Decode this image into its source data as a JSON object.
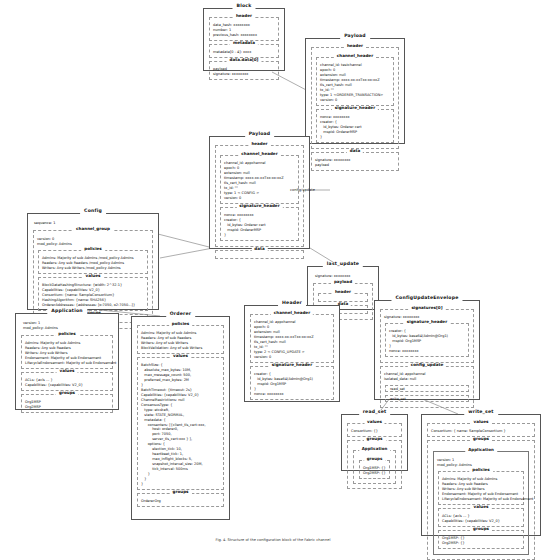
{
  "diagram": {
    "caption": "Fig. 4. Structure of the configuration block of the Fabric channel",
    "edge_labels": [
      {
        "text": "config/update"
      }
    ]
  },
  "block": {
    "title": "Block",
    "header": {
      "title": "header",
      "rows": [
        "data_hash: xxxxxxxx",
        "number: 1",
        "previous_hash: xxxxxxxx"
      ]
    },
    "metadata": {
      "title": "metadata",
      "rows": [
        "metadata[0 - 4]: xxxx"
      ]
    },
    "data": {
      "title": "data.data[0]",
      "rows": [
        "payload",
        "signature: xxxxxxxx"
      ]
    }
  },
  "payload_top": {
    "title": "Payload",
    "header": {
      "title": "header"
    },
    "channel_header": {
      "title": "channel_header",
      "rows": [
        "channel_id: testchannel",
        "epoch: 0",
        "extension: null",
        "timestamp: xxxx-xx-xxTxx:xx:xxZ",
        "tls_cert_hash: null",
        "tx_id: \"\"",
        "type: 1 <ORDERER_TRANSACTION>",
        "version: 0"
      ]
    },
    "signature_header": {
      "title": "signature_header",
      "rows": [
        "nonce: xxxxxxxx",
        "creator: {",
        "   id_bytes: Orderer cert",
        "   mspid: OrdererMSP",
        "}"
      ]
    },
    "data": {
      "title": "data",
      "rows": [
        "signature: xxxxxxxx",
        "payload"
      ]
    }
  },
  "payload_mid": {
    "title": "Payload",
    "header": {
      "title": "header"
    },
    "channel_header": {
      "title": "channel_header",
      "rows": [
        "channel_id: appchannel",
        "epoch: 0",
        "extension: null",
        "timestamp: xxxx-xx-xxTxx:xx:xxZ",
        "tls_cert_hash: null",
        "tx_id: \"\"",
        "type: 1 < CONFIG >",
        "version: 0"
      ]
    },
    "signature_header": {
      "title": "signature_header",
      "rows": [
        "nonce: xxxxxxxx",
        "creator: {",
        "   id_bytes: Orderer cert",
        "   mspid: OrdererMSP",
        "}"
      ]
    },
    "data": {
      "title": "data"
    }
  },
  "config": {
    "title": "Config",
    "sequence": "sequence: 1",
    "channel_group": {
      "title": "channel_group",
      "rows": [
        "version: 0",
        "mod_policy: Admins"
      ],
      "policies": {
        "title": "policies",
        "rows": [
          "Admins: Majority of sub Admins /mod_policy Admins",
          "Readers: Any sub Readers /mod_policy Admins",
          "Writers: Any sub Writers /mod_policy Admins"
        ]
      },
      "values": {
        "title": "values",
        "rows": [
          "BlockDataHashingStructure: {width: 2^32-1}",
          "Capabilities: {capabilities: V2_0}",
          "Consortium: {name: SampleConsortium}",
          "HashingAlgorithm: {name: SHA256}",
          "OrdererAddresses: {addresses: [o:7050, o2:7050...]}"
        ]
      },
      "groups": {
        "title": "groups"
      }
    }
  },
  "application": {
    "title": "Application",
    "rows": [
      "version: 1",
      "mod_policy: Admins"
    ],
    "policies": {
      "title": "policies",
      "rows": [
        "Admins: Majority of sub Admins",
        "Readers: Any sub Readers",
        "Writers: Any sub Writers",
        "Endorsement: Majority of sub Endorsement",
        "LifecycleEndorsement: Majority of sub Endorsement"
      ]
    },
    "values": {
      "title": "values",
      "rows": [
        "ACLs: {acls ... }",
        "Capabilities: {capabilities: V2_0}"
      ]
    },
    "groups": {
      "title": "groups",
      "rows": [
        "Org1MSP",
        "Org2MSP"
      ]
    }
  },
  "orderer": {
    "title": "Orderer",
    "policies": {
      "title": "policies",
      "rows": [
        "Admins: Majority of sub Admins",
        "Readers: Any of sub Readers",
        "Writers: Any of sub Writers",
        "BlockValidation: Any of sub Writers"
      ]
    },
    "values": {
      "title": "values",
      "rows": [
        "BatchSize: {",
        "   absolute_max_bytes: 10M,",
        "   max_message_count: 500,",
        "   preferred_max_bytes: 2M",
        "}",
        "BatchTimeout: {timeout: 2s}",
        "Capabilities: {capabilities: V2_0}",
        "ChannelRestrictions: null",
        "ConsensusType: {",
        "   type: etcdraft,",
        "   state: STATE_NORMAL,",
        "   metadata: {",
        "      consenters: [{client_tls_cert:xxx,",
        "          host: orderer0,",
        "          port: 7050,",
        "          server_tls_cert:xxx } ],",
        "      options: {",
        "          election_tick: 10,",
        "          heartbeat_tick: 1,",
        "          max_inflight_blocks: 5,",
        "          snapshot_interval_size: 20M,",
        "          tick_interval: 500ms",
        "      }",
        "   }",
        "}"
      ]
    },
    "groups": {
      "title": "groups",
      "rows": [
        "OrdererOrg"
      ]
    }
  },
  "last_update": {
    "title": "last_update",
    "rows": [
      "signature: xxxxxxxx"
    ],
    "payload": {
      "title": "payload",
      "header": {
        "title": "header"
      },
      "data": {
        "title": "data"
      }
    }
  },
  "header_box": {
    "title": "Header",
    "channel_header": {
      "title": "channel_header",
      "rows": [
        "channel_id: appchannel",
        "epoch: 0",
        "extension: null",
        "timestamp: xxxx-xx-xxTxx:xx:xxZ",
        "tls_cert_hash: null",
        "tx_id: \"\"",
        "type: 2 < CONFIG_UPDATE >",
        "version: 0"
      ]
    },
    "signature_header": {
      "title": "signature_header",
      "rows": [
        "creator: {",
        "   id_bytes: base64(Admin@Org1)",
        "   mspid: Org1MSP",
        "}",
        "nonce: xxxxxxxx"
      ]
    }
  },
  "config_update_envelope": {
    "title": "ConfigUpdateEnvelope",
    "signatures": {
      "title": "signatures[0]",
      "rows": [
        "signature: xxxxxxxx"
      ],
      "signature_header": {
        "title": "signature_header",
        "rows": [
          "creator: {",
          "   id_bytes: base64(Admin@Org1)",
          "   mspid: Org1MSP",
          "}",
          "nonce: xxxxxxxx"
        ]
      }
    },
    "config_update": {
      "title": "config_update",
      "rows": [
        "channel_id: appchannel",
        "isolated_data: null"
      ],
      "read_set_ref": "read_set",
      "write_set_ref": "write_set"
    }
  },
  "read_set": {
    "title": "read_set",
    "values": {
      "title": "values",
      "rows": [
        "Consortium: {}"
      ]
    },
    "groups": {
      "title": "groups",
      "application": {
        "title": "Application",
        "groups": {
          "title": "groups",
          "rows": [
            "Org1MSP: {}",
            "Org2MSP: {}"
          ]
        }
      }
    }
  },
  "write_set": {
    "title": "write_set",
    "values": {
      "title": "values",
      "rows": [
        "Consortium: { name: SampleConsortium }"
      ]
    },
    "groups": {
      "title": "groups",
      "application": {
        "title": "Application",
        "rows": [
          "version: 1",
          "mod_policy: Admins"
        ],
        "policies": {
          "title": "policies",
          "rows": [
            "Admins: Majority of sub Admins",
            "Readers: Any sub Readers",
            "Writers: Any sub Writers",
            "Endorsement: Majority of sub Endorsement",
            "LifecycleEndorsement: Majority of sub Endorsement"
          ]
        },
        "values": {
          "title": "values",
          "rows": [
            "ACLs: {acls ... }",
            "Capabilities: {capabilities: V2_0}"
          ]
        },
        "groups": {
          "title": "groups",
          "rows": [
            "Org1MSP: {}",
            "Org2MSP: {}"
          ]
        }
      }
    }
  }
}
